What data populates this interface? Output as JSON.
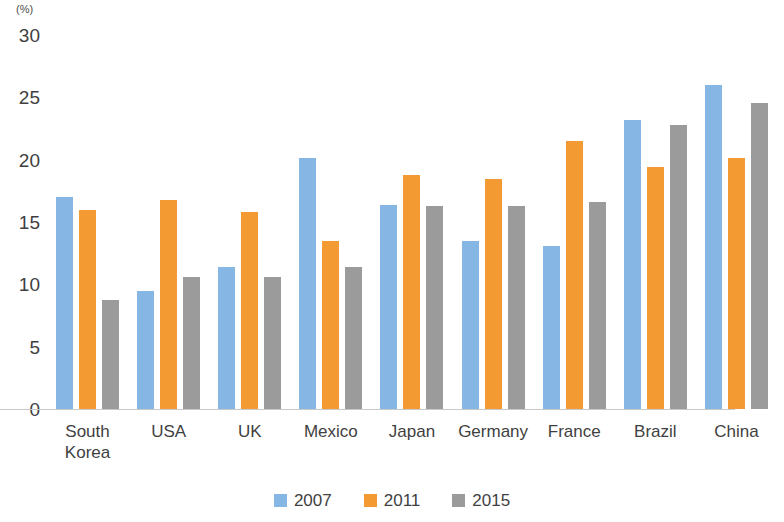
{
  "chart_data": {
    "type": "bar",
    "title": "",
    "subtitle": "",
    "xlabel": "",
    "ylabel": "(%)",
    "ylim": [
      0,
      30
    ],
    "ytick_step": 5,
    "yticks": [
      30,
      25,
      20,
      15,
      10,
      5,
      0
    ],
    "grid": false,
    "legend_position": "bottom",
    "categories": [
      "South\nKorea",
      "USA",
      "UK",
      "Mexico",
      "Japan",
      "Germany",
      "France",
      "Brazil",
      "China"
    ],
    "series": [
      {
        "name": "2007",
        "color": "#86b6e4",
        "values": [
          18.9,
          11.4,
          13.3,
          22.1,
          18.3,
          15.4,
          15.0,
          25.1,
          27.9
        ]
      },
      {
        "name": "2011",
        "color": "#f39a33",
        "values": [
          17.9,
          18.7,
          17.7,
          15.4,
          20.7,
          20.4,
          23.4,
          21.3,
          22.1
        ]
      },
      {
        "name": "2015",
        "color": "#9b9b9b",
        "values": [
          10.7,
          12.5,
          12.5,
          13.3,
          18.2,
          18.2,
          18.5,
          24.7,
          26.5
        ]
      }
    ]
  }
}
